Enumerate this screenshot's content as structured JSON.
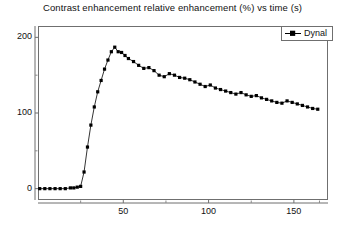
{
  "chart_data": {
    "type": "line",
    "title": "Contrast enhancement relative enhancement (%) vs time (s)",
    "xlabel": "",
    "ylabel": "",
    "xlim": [
      0,
      170
    ],
    "ylim": [
      -15,
      215
    ],
    "grid": false,
    "legend_position": "top-right",
    "xticks": [
      50,
      100,
      150
    ],
    "xminorticks": [
      25,
      75,
      125,
      165
    ],
    "yticks": [
      0,
      100,
      200
    ],
    "yminorticks": [
      50,
      150
    ],
    "marker": "square",
    "marker_color": "#000000",
    "line_color": "#000000",
    "series": [
      {
        "name": "Dynal",
        "x": [
          1,
          4,
          7,
          10,
          13,
          16,
          19,
          21,
          23,
          25,
          27,
          29,
          31,
          33,
          35,
          37,
          39,
          41,
          43,
          45,
          47,
          49,
          51,
          53,
          56,
          59,
          62,
          65,
          68,
          71,
          74,
          77,
          80,
          83,
          86,
          89,
          92,
          95,
          98,
          101,
          104,
          107,
          110,
          113,
          116,
          119,
          122,
          125,
          128,
          131,
          134,
          137,
          140,
          143,
          146,
          149,
          152,
          155,
          158,
          161,
          164
        ],
        "y": [
          0,
          0,
          0,
          0,
          0,
          0,
          1,
          1,
          2,
          3,
          22,
          55,
          84,
          108,
          128,
          143,
          158,
          170,
          181,
          187,
          181,
          180,
          176,
          172,
          168,
          163,
          159,
          160,
          156,
          150,
          148,
          152,
          150,
          147,
          146,
          144,
          141,
          138,
          135,
          137,
          133,
          131,
          129,
          127,
          125,
          127,
          124,
          122,
          123,
          120,
          118,
          116,
          114,
          113,
          116,
          114,
          112,
          110,
          108,
          106,
          105
        ]
      }
    ]
  },
  "legend": {
    "entries": [
      {
        "label": "Dynal"
      }
    ]
  }
}
